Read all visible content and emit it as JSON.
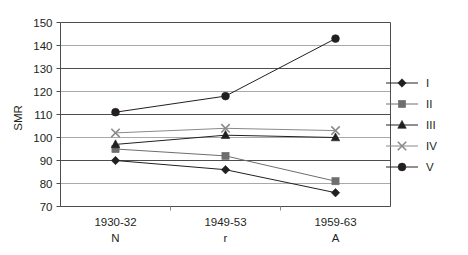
{
  "chart_data": {
    "type": "line",
    "title": "",
    "xlabel": "",
    "ylabel": "SMR",
    "ylim": [
      70,
      150
    ],
    "ytick_labels": [
      "150",
      "140",
      "130",
      "120",
      "110",
      "100",
      "90",
      "80",
      "70"
    ],
    "ytick_values": [
      150,
      140,
      130,
      120,
      110,
      100,
      90,
      80,
      70
    ],
    "grid": true,
    "legend_position": "right",
    "categories": [
      "1930-32",
      "1949-53",
      "1959-63"
    ],
    "category_sublabels": [
      "N",
      "r",
      "A"
    ],
    "series": [
      {
        "name": "I",
        "marker": "diamond",
        "color": "#231f20",
        "values": [
          90,
          86,
          76
        ]
      },
      {
        "name": "II",
        "marker": "square",
        "color": "#6e6e6e",
        "values": [
          95,
          92,
          81
        ]
      },
      {
        "name": "III",
        "marker": "triangle",
        "color": "#231f20",
        "values": [
          97,
          101,
          100
        ]
      },
      {
        "name": "IV",
        "marker": "cross",
        "color": "#8a8a8a",
        "values": [
          102,
          104,
          103
        ]
      },
      {
        "name": "V",
        "marker": "circle",
        "color": "#231f20",
        "values": [
          111,
          118,
          143
        ]
      }
    ]
  },
  "legend": {
    "entries": [
      {
        "label": "I"
      },
      {
        "label": "II"
      },
      {
        "label": "III"
      },
      {
        "label": "IV"
      },
      {
        "label": "V"
      }
    ]
  },
  "axes": {
    "y_title": "SMR"
  }
}
